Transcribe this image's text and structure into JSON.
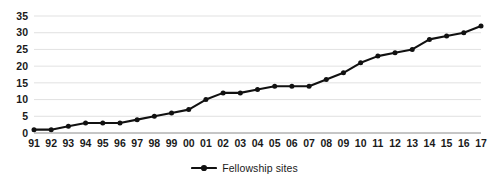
{
  "chart_data": {
    "type": "line",
    "title": "",
    "subtitle": "",
    "xlabel": "",
    "ylabel": "",
    "categories": [
      "91",
      "92",
      "93",
      "94",
      "95",
      "96",
      "97",
      "98",
      "99",
      "00",
      "01",
      "02",
      "03",
      "04",
      "05",
      "06",
      "07",
      "08",
      "09",
      "10",
      "11",
      "12",
      "13",
      "14",
      "15",
      "16",
      "17"
    ],
    "series": [
      {
        "name": "Fellowship sites",
        "color": "#111111",
        "marker": "circle",
        "values": [
          1,
          1,
          2,
          3,
          3,
          3,
          4,
          5,
          6,
          7,
          10,
          12,
          12,
          13,
          14,
          14,
          14,
          16,
          18,
          21,
          23,
          24,
          25,
          28,
          29,
          30,
          32
        ]
      }
    ],
    "ylim": [
      0,
      35
    ],
    "yticks": [
      0,
      5,
      10,
      15,
      20,
      25,
      30,
      35
    ],
    "ytick_labels": [
      "0",
      "5",
      "10",
      "15",
      "20",
      "25",
      "30",
      "35"
    ],
    "grid": true,
    "grid_axis": "y",
    "legend": {
      "position": "bottom",
      "entries": [
        {
          "label": "Fellowship sites",
          "symbol": "line-with-marker",
          "color": "#111111"
        }
      ]
    },
    "colors": {
      "series": "#111111",
      "gridline": "#d9d9d9",
      "axis": "#808080",
      "text": "#1a1a1a",
      "background": "#ffffff"
    }
  }
}
